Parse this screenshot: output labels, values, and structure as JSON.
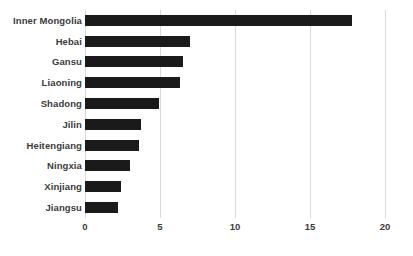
{
  "chart_data": {
    "type": "bar",
    "orientation": "horizontal",
    "title": "",
    "subtitle": "",
    "xlabel": "",
    "ylabel": "",
    "xlim": [
      0,
      20
    ],
    "xticks": [
      0,
      5,
      10,
      15,
      20
    ],
    "xtick_labels": [
      "0",
      "5",
      "10",
      "15",
      "20"
    ],
    "grid": "vertical",
    "legend": "none",
    "bar_color": "#1a1a1a",
    "gridline_color": "#d9d9d9",
    "label_color": "#3b3b3b",
    "categories": [
      "Inner Mongolia",
      "Hebai",
      "Gansu",
      "Liaoning",
      "Shadong",
      "Jilin",
      "Heitengiang",
      "Ningxia",
      "Xinjiang",
      "Jiangsu"
    ],
    "values": [
      17.8,
      7.0,
      6.5,
      6.3,
      4.9,
      3.7,
      3.6,
      3.0,
      2.4,
      2.2
    ]
  }
}
